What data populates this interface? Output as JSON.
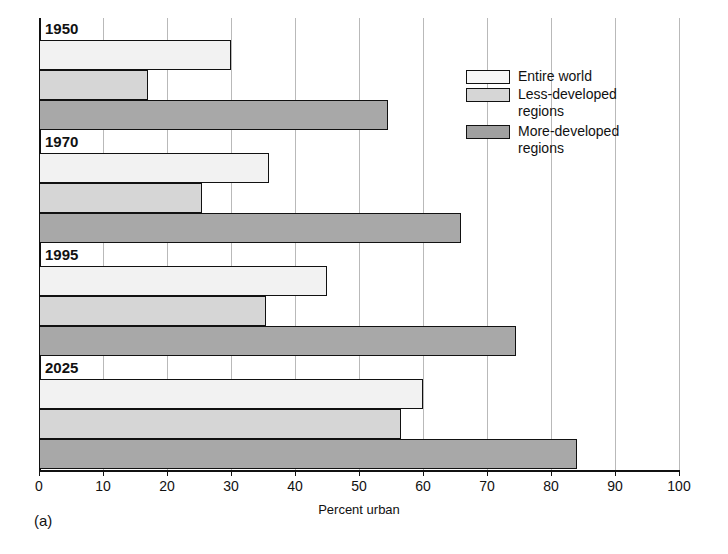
{
  "caption": "(a)",
  "chart_data": {
    "type": "bar",
    "orientation": "horizontal",
    "title": "",
    "xlabel": "Percent urban",
    "ylabel": "",
    "xlim": [
      0,
      100
    ],
    "xticks": [
      0,
      10,
      20,
      30,
      40,
      50,
      60,
      70,
      80,
      90,
      100
    ],
    "xtick_labels": [
      "0",
      "10",
      "20",
      "30",
      "40",
      "50",
      "60",
      "70",
      "80",
      "90",
      "100"
    ],
    "grid": true,
    "grid_axis": "x",
    "legend_position": "upper right",
    "categories": [
      "1950",
      "1970",
      "1995",
      "2025"
    ],
    "series": [
      {
        "name": "Entire world",
        "color": "#f2f2f2",
        "values": [
          30,
          36,
          45,
          60
        ]
      },
      {
        "name": "Less-developed regions",
        "color": "#d6d6d6",
        "values": [
          17,
          25.5,
          35.5,
          56.5
        ]
      },
      {
        "name": "More-developed regions",
        "color": "#a8a8a8",
        "values": [
          54.5,
          66,
          74.5,
          84
        ]
      }
    ]
  },
  "legend": {
    "items": [
      {
        "label": "Entire world",
        "swatch": "entire"
      },
      {
        "label": "Less-developed\nregions",
        "swatch": "less"
      },
      {
        "label": "More-developed\nregions",
        "swatch": "more"
      }
    ]
  },
  "axis": {
    "x_title": "Percent urban"
  },
  "colors": {
    "entire_world": "#f2f2f2",
    "less_developed": "#d6d6d6",
    "more_developed": "#a8a8a8",
    "axis": "#111111",
    "gridline": "#b9b9b9"
  }
}
